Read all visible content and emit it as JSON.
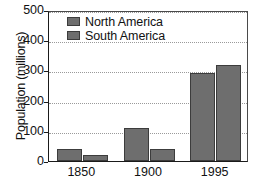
{
  "chart_data": {
    "type": "bar",
    "title": "",
    "xlabel": "",
    "ylabel": "Population (millions)",
    "categories": [
      "1850",
      "1900",
      "1995"
    ],
    "series": [
      {
        "name": "North America",
        "values": [
          39,
          108,
          293
        ],
        "color": "#6e6e6e"
      },
      {
        "name": "South America",
        "values": [
          20,
          39,
          318
        ],
        "color": "#6e6e6e"
      }
    ],
    "ylim": [
      0,
      500
    ],
    "yticks": [
      0,
      100,
      200,
      300,
      400,
      500
    ],
    "ytick_labels": [
      "0",
      "100",
      "200",
      "300",
      "400",
      "500"
    ],
    "grid": true,
    "grid_axis": "y",
    "grid_style": "dotted",
    "legend_position": "upper-left-inside",
    "legend": [
      "North America",
      "South America"
    ],
    "bar_color": "#6e6e6e",
    "bar_edge_color": "#3c3c3c",
    "axis_color": "#1a1a1a",
    "background": "#ffffff"
  }
}
